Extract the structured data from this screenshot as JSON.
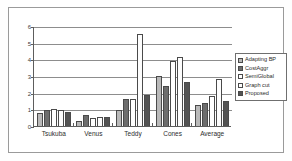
{
  "chart_data": {
    "type": "bar",
    "title": "",
    "subtitle": "",
    "xlabel": "",
    "ylabel": "",
    "ylim": [
      0,
      6
    ],
    "yticks": [
      0,
      1,
      2,
      3,
      4,
      5,
      6
    ],
    "ytick_labels": [
      "0",
      "1",
      "2",
      "3",
      "4",
      "5",
      "6"
    ],
    "grid": true,
    "legend_position": "right",
    "categories": [
      "Tsukuba",
      "Venus",
      "Teddy",
      "Cones",
      "Average"
    ],
    "series": [
      {
        "name": "Adapting BP",
        "color": "#b9b9b9",
        "values": [
          0.77,
          0.3,
          0.95,
          3.0,
          1.27
        ]
      },
      {
        "name": "CostAggr",
        "color": "#6d6d6d",
        "values": [
          0.95,
          0.65,
          1.62,
          2.42,
          1.38
        ]
      },
      {
        "name": "SemiGlobal",
        "color": "#ffffff",
        "values": [
          1.0,
          0.5,
          1.6,
          3.9,
          1.8
        ]
      },
      {
        "name": "Graph cut",
        "color": "#fdfdfd",
        "values": [
          0.95,
          0.52,
          5.5,
          4.12,
          2.8
        ]
      },
      {
        "name": "Proposed",
        "color": "#535353",
        "values": [
          0.82,
          0.57,
          1.85,
          2.65,
          1.48
        ]
      }
    ]
  },
  "legend": {
    "items": [
      {
        "label": "Adapting BP",
        "swatch": "#b9b9b9"
      },
      {
        "label": "CostAggr",
        "swatch": "#6d6d6d"
      },
      {
        "label": "SemiGlobal",
        "swatch": "#ffffff"
      },
      {
        "label": "Graph cut",
        "swatch": "#fdfdfd"
      },
      {
        "label": "Proposed",
        "swatch": "#535353"
      }
    ]
  }
}
